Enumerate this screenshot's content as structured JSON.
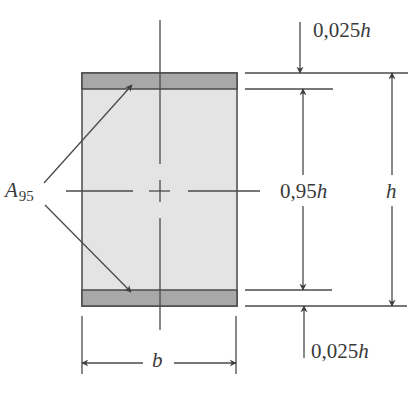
{
  "diagram": {
    "type": "cross-section",
    "colors": {
      "ink": "#4a4a4a",
      "concrete_fill": "#e4e4e4",
      "reinforcement_fill": "#a8a8a8",
      "background": "#ffffff"
    },
    "labels": {
      "area": {
        "main": "A",
        "subscript": "95"
      },
      "top_cover": {
        "value": "0,025",
        "var": "h"
      },
      "inner_height": {
        "value": "0,95",
        "var": "h"
      },
      "total_height": {
        "value": "",
        "var": "h"
      },
      "bottom_cover": {
        "value": "0,025",
        "var": "h"
      },
      "width": {
        "value": "",
        "var": "b"
      }
    }
  }
}
